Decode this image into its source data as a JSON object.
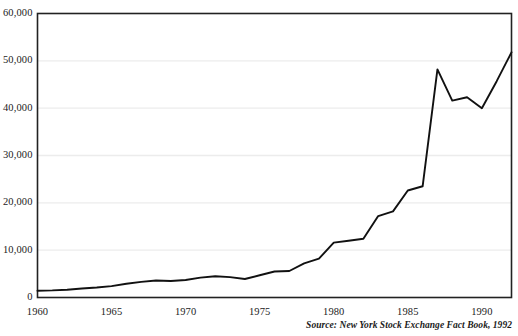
{
  "chart_data": {
    "type": "line",
    "title": "",
    "subtitle": "",
    "xlabel": "",
    "ylabel": "",
    "xlim": [
      1960,
      1992
    ],
    "ylim": [
      0,
      60000
    ],
    "grid": "horizontal",
    "legend": "none",
    "x": [
      1960,
      1961,
      1962,
      1963,
      1964,
      1965,
      1966,
      1967,
      1968,
      1969,
      1970,
      1971,
      1972,
      1973,
      1974,
      1975,
      1976,
      1977,
      1978,
      1979,
      1980,
      1981,
      1982,
      1983,
      1984,
      1985,
      1986,
      1987,
      1988,
      1989,
      1990,
      1991,
      1992
    ],
    "values": [
      1441,
      1500,
      1650,
      1900,
      2100,
      2400,
      2900,
      3300,
      3600,
      3500,
      3700,
      4200,
      4500,
      4300,
      3900,
      4700,
      5500,
      5600,
      7200,
      8200,
      11600,
      12000,
      12400,
      17200,
      18200,
      22600,
      23500,
      48200,
      41600,
      42300,
      40000,
      45700,
      51800
    ]
  },
  "axes": {
    "y_ticks": [
      {
        "label": "0",
        "value": 0
      },
      {
        "label": "10,000",
        "value": 10000
      },
      {
        "label": "20,000",
        "value": 20000
      },
      {
        "label": "30,000",
        "value": 30000
      },
      {
        "label": "40,000",
        "value": 40000
      },
      {
        "label": "50,000",
        "value": 50000
      },
      {
        "label": "60,000",
        "value": 60000
      }
    ],
    "x_ticks": [
      {
        "label": "1960",
        "value": 1960
      },
      {
        "label": "1965",
        "value": 1965
      },
      {
        "label": "1970",
        "value": 1970
      },
      {
        "label": "1975",
        "value": 1975
      },
      {
        "label": "1980",
        "value": 1980
      },
      {
        "label": "1985",
        "value": 1985
      },
      {
        "label": "1990",
        "value": 1990
      }
    ]
  },
  "source": {
    "text": "Source: New York Stock Exchange Fact Book, 1992"
  },
  "colors": {
    "line": "#111111",
    "frame": "#222222",
    "grid": "#ececec",
    "background": "#ffffff",
    "text": "#1b1b1b"
  }
}
